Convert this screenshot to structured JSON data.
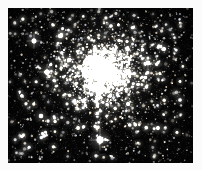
{
  "figure": {
    "title": "",
    "caption": "",
    "object_type": "globular-star-cluster"
  },
  "plate": {
    "background_color": "#fbfbfb",
    "width": 202,
    "height": 170
  },
  "frame": {
    "x": 8,
    "y": 8,
    "width": 185,
    "height": 155,
    "sky_color": "#050505",
    "border_color": "#fbfbfb"
  },
  "chart_data": {
    "type": "scatter",
    "title": "",
    "subtitle": "",
    "xlabel": "",
    "ylabel": "",
    "xlim": [
      0,
      185
    ],
    "ylim": [
      0,
      155
    ],
    "grid": false,
    "legend": null,
    "annotations": [],
    "tick_labels": {
      "x": [],
      "y": []
    },
    "halo": {
      "center_x": 95,
      "center_y": 64,
      "radius_inner": 16,
      "radius_mid": 38,
      "radius_outer": 74,
      "peak_brightness": 0.62,
      "color": "#fffdf2"
    },
    "star_counts": {
      "core_population": 2200,
      "halo_population": 1400,
      "field_population": 900,
      "total": 4500
    },
    "star_color_palette": [
      "#ffffff",
      "#fff6e2",
      "#ffeccd",
      "#e8f0ff",
      "#fffaf0"
    ],
    "bright_stars": [
      {
        "x": 92,
        "y": 132,
        "r": 3.4,
        "brightness": 1.0,
        "color": "#ffffff",
        "label": "foreground-star-bright"
      },
      {
        "x": 39,
        "y": 64,
        "r": 2.6,
        "brightness": 0.94,
        "color": "#fff8ea",
        "label": "field-star-left"
      },
      {
        "x": 26,
        "y": 33,
        "r": 2.4,
        "brightness": 0.92,
        "color": "#ffffff",
        "label": "field-star-upper-left"
      },
      {
        "x": 52,
        "y": 28,
        "r": 2.1,
        "brightness": 0.88,
        "color": "#fff4e0",
        "label": "field-star-top"
      },
      {
        "x": 61,
        "y": 52,
        "r": 2.0,
        "brightness": 0.86,
        "color": "#ffffff",
        "label": "field-star-inner-left"
      },
      {
        "x": 140,
        "y": 55,
        "r": 2.3,
        "brightness": 0.9,
        "color": "#fff6e6",
        "label": "field-star-right"
      },
      {
        "x": 156,
        "y": 41,
        "r": 2.0,
        "brightness": 0.84,
        "color": "#ffffff",
        "label": "field-star-upper-right"
      },
      {
        "x": 120,
        "y": 96,
        "r": 2.0,
        "brightness": 0.83,
        "color": "#fffaf0",
        "label": "field-star-lower-right"
      },
      {
        "x": 33,
        "y": 108,
        "r": 2.2,
        "brightness": 0.87,
        "color": "#ffffff",
        "label": "field-star-lower-left"
      },
      {
        "x": 70,
        "y": 120,
        "r": 1.9,
        "brightness": 0.8,
        "color": "#fff5e4",
        "label": "field-star-bottom-left"
      },
      {
        "x": 150,
        "y": 120,
        "r": 1.9,
        "brightness": 0.8,
        "color": "#ffffff",
        "label": "field-star-bottom-right"
      },
      {
        "x": 14,
        "y": 88,
        "r": 1.8,
        "brightness": 0.78,
        "color": "#fffbf2",
        "label": "field-star-edge-left"
      },
      {
        "x": 172,
        "y": 92,
        "r": 1.8,
        "brightness": 0.78,
        "color": "#ffffff",
        "label": "field-star-edge-right"
      },
      {
        "x": 103,
        "y": 18,
        "r": 1.8,
        "brightness": 0.76,
        "color": "#fff7e8",
        "label": "field-star-edge-top"
      },
      {
        "x": 88,
        "y": 148,
        "r": 1.7,
        "brightness": 0.74,
        "color": "#ffffff",
        "label": "field-star-edge-bottom"
      }
    ],
    "noise": {
      "background_level": 0.03,
      "seed": 20240517
    }
  }
}
